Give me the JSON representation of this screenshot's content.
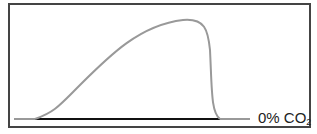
{
  "diagram": {
    "baseline_label": "0% CO",
    "baseline_label_subscript": "2",
    "colors": {
      "curve": "#999999",
      "baseline": "#111111",
      "frame": "#444444"
    }
  }
}
